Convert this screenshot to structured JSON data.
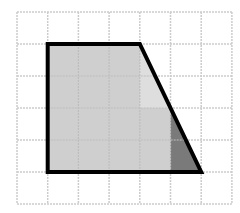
{
  "figure": {
    "grid": {
      "cols": 7,
      "rows": 6,
      "origin_x": 17,
      "origin_y": 12,
      "cell_w": 30.7,
      "cell_h": 32,
      "line_color": "#cccccc"
    },
    "trapezoid": {
      "vertices_grid": [
        [
          1,
          1
        ],
        [
          4,
          1
        ],
        [
          6,
          5
        ],
        [
          1,
          5
        ]
      ],
      "fill": "#cfcfcf",
      "stroke": "#000000",
      "stroke_width": 4
    },
    "light_cell": {
      "description": "lighter region in column 3, row 1-2 along diagonal",
      "fill": "#dedede"
    },
    "dark_triangle": {
      "vertices_grid": [
        [
          5,
          3
        ],
        [
          6,
          5
        ],
        [
          5,
          5
        ]
      ],
      "fill": "#7a7a7a"
    }
  }
}
